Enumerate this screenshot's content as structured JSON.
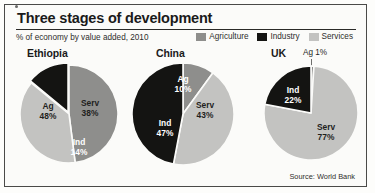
{
  "frame": {
    "border_color": "#4a4a48",
    "background": "#fbfbf9"
  },
  "header": {
    "title": "Three stages of development",
    "subtitle": "% of economy by value added, 2010"
  },
  "legend": {
    "items": [
      {
        "label": "Agriculture",
        "color": "#8e8e8c"
      },
      {
        "label": "Industry",
        "color": "#141412"
      },
      {
        "label": "Services",
        "color": "#c3c3c1"
      }
    ]
  },
  "source": "Source: World Bank",
  "chart_data": {
    "type": "pie",
    "title": "Three stages of development",
    "subtitle": "% of economy by value added, 2010",
    "unit": "%",
    "legend_position": "top-right",
    "series_names": [
      "Agriculture",
      "Industry",
      "Services"
    ],
    "colors": {
      "Agriculture": "#8e8e8c",
      "Industry": "#141412",
      "Services": "#c3c3c1"
    },
    "charts": [
      {
        "name": "Ethiopia",
        "slices": [
          {
            "label": "Ag",
            "category": "Agriculture",
            "value": 48,
            "value_label": "48%"
          },
          {
            "label": "Serv",
            "category": "Services",
            "value": 38,
            "value_label": "38%"
          },
          {
            "label": "Ind",
            "category": "Industry",
            "value": 14,
            "value_label": "14%"
          }
        ]
      },
      {
        "name": "China",
        "slices": [
          {
            "label": "Ag",
            "category": "Agriculture",
            "value": 10,
            "value_label": "10%"
          },
          {
            "label": "Serv",
            "category": "Services",
            "value": 43,
            "value_label": "43%"
          },
          {
            "label": "Ind",
            "category": "Industry",
            "value": 47,
            "value_label": "47%"
          }
        ]
      },
      {
        "name": "UK",
        "slices": [
          {
            "label": "Ag",
            "category": "Agriculture",
            "value": 1,
            "value_label": "1%"
          },
          {
            "label": "Serv",
            "category": "Services",
            "value": 77,
            "value_label": "77%"
          },
          {
            "label": "Ind",
            "category": "Industry",
            "value": 22,
            "value_label": "22%"
          }
        ]
      }
    ]
  },
  "labels": {
    "ethiopia": {
      "country": "Ethiopia",
      "ag_l1": "Ag",
      "ag_l2": "48%",
      "serv_l1": "Serv",
      "serv_l2": "38%",
      "ind_l1": "Ind",
      "ind_l2": "14%"
    },
    "china": {
      "country": "China",
      "ag_l1": "Ag",
      "ag_l2": "10%",
      "serv_l1": "Serv",
      "serv_l2": "43%",
      "ind_l1": "Ind",
      "ind_l2": "47%"
    },
    "uk": {
      "country": "UK",
      "ag_callout": "Ag 1%",
      "serv_l1": "Serv",
      "serv_l2": "77%",
      "ind_l1": "Ind",
      "ind_l2": "22%"
    }
  }
}
